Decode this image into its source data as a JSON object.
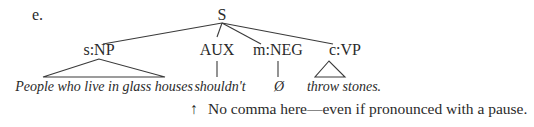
{
  "example_label": "e.",
  "tree": {
    "root": "S",
    "constituents": [
      {
        "id": "np",
        "label": "s:NP",
        "branch": "triangle",
        "leaf": "People who live in glass houses"
      },
      {
        "id": "aux",
        "label": "AUX",
        "branch": "line",
        "leaf": "shouldn't"
      },
      {
        "id": "neg",
        "label": "m:NEG",
        "branch": "line",
        "leaf": "Ø"
      },
      {
        "id": "vp",
        "label": "c:VP",
        "branch": "triangle",
        "leaf": "throw stones."
      }
    ]
  },
  "annotation": {
    "arrow_icon": "up-arrow",
    "arrow_glyph": "↑",
    "text": "No comma here—even if pronounced with a pause."
  }
}
